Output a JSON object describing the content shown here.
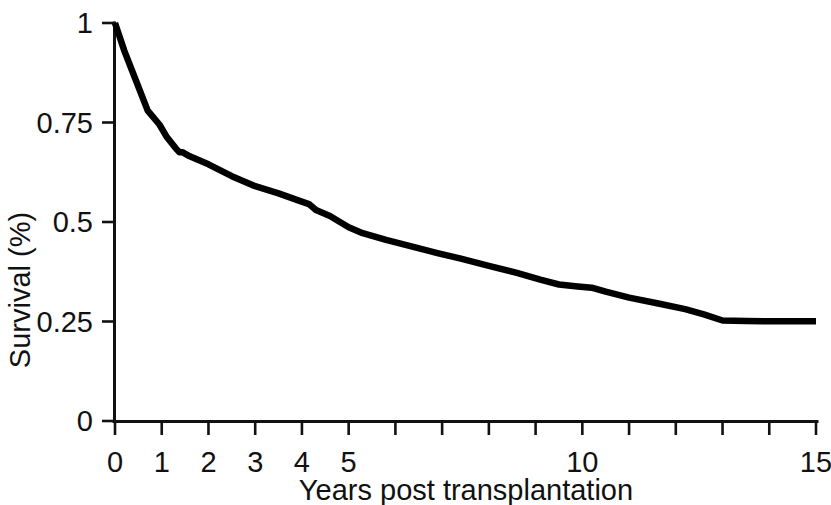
{
  "chart_data": {
    "type": "line",
    "title": "",
    "subtitle": "",
    "xlabel": "Years post transplantation",
    "ylabel": "Survival (%)",
    "xlim": [
      0,
      15
    ],
    "ylim": [
      0,
      1
    ],
    "grid": false,
    "legend": null,
    "x_ticks": [
      0,
      1,
      2,
      3,
      4,
      5,
      6,
      7,
      8,
      9,
      10,
      11,
      12,
      13,
      14,
      15
    ],
    "x_tick_labels": [
      "0",
      "1",
      "2",
      "3",
      "4",
      "5",
      "",
      "",
      "",
      "",
      "10",
      "",
      "",
      "",
      "",
      "15"
    ],
    "y_ticks": [
      0,
      0.25,
      0.5,
      0.75,
      1
    ],
    "y_tick_labels": [
      "0",
      "0.25",
      "0.5",
      "0.75",
      "1"
    ],
    "line_color": "#000000",
    "series": [
      {
        "name": "Survival",
        "x": [
          0,
          0.2,
          0.45,
          0.7,
          0.95,
          1.1,
          1.3,
          1.38,
          1.45,
          1.6,
          2.0,
          2.5,
          3.0,
          3.5,
          3.95,
          4.15,
          4.3,
          4.6,
          5.0,
          5.3,
          5.8,
          6.3,
          6.9,
          7.4,
          8.0,
          8.6,
          9.1,
          9.5,
          9.9,
          10.2,
          10.5,
          11.0,
          11.6,
          12.2,
          12.6,
          13.0,
          13.5,
          14.2,
          15.0
        ],
        "y": [
          1.0,
          0.93,
          0.855,
          0.78,
          0.745,
          0.715,
          0.685,
          0.675,
          0.675,
          0.665,
          0.645,
          0.615,
          0.59,
          0.572,
          0.553,
          0.545,
          0.53,
          0.515,
          0.487,
          0.472,
          0.455,
          0.44,
          0.422,
          0.408,
          0.39,
          0.372,
          0.355,
          0.343,
          0.338,
          0.335,
          0.325,
          0.31,
          0.296,
          0.281,
          0.268,
          0.2525,
          0.251,
          0.2505,
          0.2505
        ]
      }
    ],
    "annotations": []
  },
  "axes": {
    "y_axis_label": "Survival (%)",
    "x_axis_label": "Years post transplantation"
  }
}
